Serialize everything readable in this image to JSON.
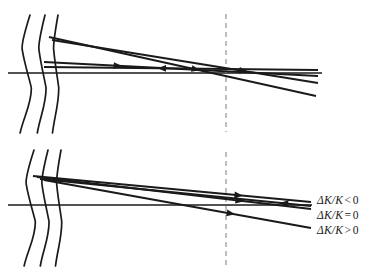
{
  "figure": {
    "title": "",
    "width": 387,
    "height": 271,
    "background": "#ffffff",
    "stroke_color": "#1a1a1a",
    "dashed_color": "#9a9a9a"
  },
  "panels": [
    {
      "id": "top-panel",
      "name": "upper-ray-diagram",
      "axis_y": 73,
      "axis_x_start": 8,
      "axis_x_end": 322,
      "dashed_line_x": 226,
      "dashed_line_y_top": 14,
      "dashed_line_y_bottom": 132,
      "wavefronts": [
        {
          "name": "wavefront-1",
          "x_top": 30,
          "y_top": 15,
          "y_bottom": 133,
          "bow": 9
        },
        {
          "name": "wavefront-2",
          "x_top": 45,
          "y_top": 15,
          "y_bottom": 133,
          "bow": 7
        },
        {
          "name": "wavefront-3",
          "x_top": 58,
          "y_top": 15,
          "y_bottom": 133,
          "bow": 5
        }
      ],
      "rays": [
        {
          "name": "ray-upper",
          "x1": 49,
          "y1": 37,
          "x2": 316,
          "y2": 96,
          "arrow_at": 0.55,
          "arrow_dir": "right"
        },
        {
          "name": "ray-middle",
          "x1": 52,
          "y1": 40,
          "x2": 318,
          "y2": 83,
          "arrow_at": 0.72,
          "arrow_dir": "right"
        },
        {
          "name": "ray-lower-a",
          "x1": 44,
          "y1": 62,
          "x2": 318,
          "y2": 76,
          "arrow_at": 0.27,
          "arrow_dir": "right"
        },
        {
          "name": "ray-lower-b",
          "x1": 44,
          "y1": 67,
          "x2": 318,
          "y2": 70,
          "arrow_at": 0.43,
          "arrow_dir": "left"
        }
      ]
    },
    {
      "id": "bottom-panel",
      "name": "lower-ray-diagram",
      "axis_y": 205,
      "axis_x_start": 8,
      "axis_x_end": 312,
      "dashed_line_x": 226,
      "dashed_line_y_top": 152,
      "dashed_line_y_bottom": 266,
      "wavefronts": [
        {
          "name": "wavefront-1",
          "x_top": 34,
          "y_top": 150,
          "y_bottom": 266,
          "bow": 9
        },
        {
          "name": "wavefront-2",
          "x_top": 48,
          "y_top": 150,
          "y_bottom": 266,
          "bow": 7
        },
        {
          "name": "wavefront-3",
          "x_top": 61,
          "y_top": 150,
          "y_bottom": 266,
          "bow": 5
        }
      ],
      "rays": [
        {
          "name": "ray-negative",
          "x1": 33,
          "y1": 176,
          "x2": 311,
          "y2": 202,
          "arrow_at": 0.74,
          "arrow_dir": "right"
        },
        {
          "name": "ray-zero",
          "x1": 37,
          "y1": 177,
          "x2": 311,
          "y2": 209,
          "arrow_at": 0.74,
          "arrow_dir": "right"
        },
        {
          "name": "ray-return",
          "x1": 40,
          "y1": 179,
          "x2": 311,
          "y2": 206,
          "arrow_at": 0.9,
          "arrow_dir": "left"
        },
        {
          "name": "ray-positive",
          "x1": 44,
          "y1": 180,
          "x2": 311,
          "y2": 228,
          "arrow_at": 0.7,
          "arrow_dir": "right"
        }
      ]
    }
  ],
  "legend": {
    "name": "delta-k-legend",
    "entries": [
      {
        "symbol": "ΔK/K",
        "operator": "<",
        "value": "0",
        "full": "ΔK/K < 0"
      },
      {
        "symbol": "ΔK/K",
        "operator": "=",
        "value": "0",
        "full": "ΔK/K = 0"
      },
      {
        "symbol": "ΔK/K",
        "operator": ">",
        "value": "0",
        "full": "ΔK/K > 0"
      }
    ]
  }
}
